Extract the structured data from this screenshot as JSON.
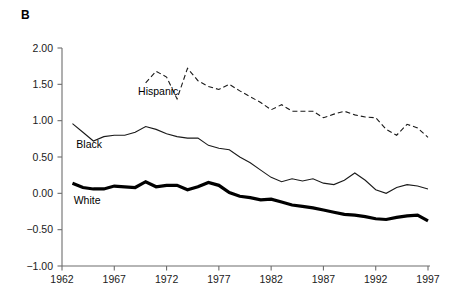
{
  "figure": {
    "panel_label": "B",
    "background": "#ffffff"
  },
  "chart_data": {
    "type": "line",
    "title": "",
    "subtitle": "",
    "xlabel": "",
    "ylabel": "",
    "xlim": [
      1962,
      1997
    ],
    "ylim": [
      -1.0,
      2.0
    ],
    "grid": false,
    "legend": "inline-labels",
    "xticks": [
      1962,
      1967,
      1972,
      1977,
      1982,
      1987,
      1992,
      1997
    ],
    "xticklabels": [
      "1962",
      "1967",
      "1972",
      "1977",
      "1982",
      "1987",
      "1992",
      "1997"
    ],
    "yticks": [
      -1.0,
      -0.5,
      0.0,
      0.5,
      1.0,
      1.5,
      2.0
    ],
    "yticklabels": [
      "−1.00",
      "−0.50",
      "0.00",
      "0.50",
      "1.00",
      "1.50",
      "2.00"
    ],
    "annotations": [
      {
        "text": "Hispanic",
        "x": 1971.2,
        "y": 1.36
      },
      {
        "text": "Black",
        "x": 1964.6,
        "y": 0.63
      },
      {
        "text": "White",
        "x": 1964.4,
        "y": -0.14
      }
    ],
    "series": [
      {
        "name": "Hispanic",
        "label": "Hispanic",
        "color": "#1a1a1a",
        "style": "dashed",
        "width": 1.1,
        "x": [
          1970,
          1971,
          1972,
          1973,
          1974,
          1975,
          1976,
          1977,
          1978,
          1979,
          1980,
          1981,
          1982,
          1983,
          1984,
          1985,
          1986,
          1987,
          1988,
          1989,
          1990,
          1991,
          1992,
          1993,
          1994,
          1995,
          1996,
          1997
        ],
        "values": [
          1.52,
          1.68,
          1.6,
          1.3,
          1.72,
          1.55,
          1.47,
          1.43,
          1.5,
          1.41,
          1.33,
          1.25,
          1.15,
          1.22,
          1.13,
          1.13,
          1.13,
          1.04,
          1.09,
          1.13,
          1.08,
          1.05,
          1.04,
          0.88,
          0.8,
          0.95,
          0.9,
          0.77
        ]
      },
      {
        "name": "Black",
        "label": "Black",
        "color": "#1a1a1a",
        "style": "solid",
        "width": 1.1,
        "x": [
          1963,
          1964,
          1965,
          1966,
          1967,
          1968,
          1969,
          1970,
          1971,
          1972,
          1973,
          1974,
          1975,
          1976,
          1977,
          1978,
          1979,
          1980,
          1981,
          1982,
          1983,
          1984,
          1985,
          1986,
          1987,
          1988,
          1989,
          1990,
          1991,
          1992,
          1993,
          1994,
          1995,
          1996,
          1997
        ],
        "values": [
          0.96,
          0.84,
          0.72,
          0.78,
          0.8,
          0.8,
          0.84,
          0.92,
          0.88,
          0.82,
          0.78,
          0.76,
          0.76,
          0.66,
          0.62,
          0.6,
          0.5,
          0.42,
          0.32,
          0.22,
          0.16,
          0.2,
          0.17,
          0.2,
          0.14,
          0.12,
          0.18,
          0.28,
          0.18,
          0.05,
          0.0,
          0.08,
          0.12,
          0.1,
          0.06
        ]
      },
      {
        "name": "White",
        "label": "White",
        "color": "#000000",
        "style": "solid-bold",
        "width": 3.2,
        "x": [
          1963,
          1964,
          1965,
          1966,
          1967,
          1968,
          1969,
          1970,
          1971,
          1972,
          1973,
          1974,
          1975,
          1976,
          1977,
          1978,
          1979,
          1980,
          1981,
          1982,
          1983,
          1984,
          1985,
          1986,
          1987,
          1988,
          1989,
          1990,
          1991,
          1992,
          1993,
          1994,
          1995,
          1996,
          1997
        ],
        "values": [
          0.14,
          0.08,
          0.06,
          0.06,
          0.1,
          0.09,
          0.08,
          0.16,
          0.09,
          0.11,
          0.11,
          0.05,
          0.09,
          0.15,
          0.11,
          0.01,
          -0.04,
          -0.06,
          -0.09,
          -0.08,
          -0.12,
          -0.16,
          -0.18,
          -0.2,
          -0.23,
          -0.26,
          -0.29,
          -0.3,
          -0.32,
          -0.35,
          -0.36,
          -0.33,
          -0.31,
          -0.3,
          -0.38
        ]
      }
    ]
  },
  "axes": {
    "axis_color": "#6d6d6d",
    "tick_color": "#6d6d6d"
  }
}
